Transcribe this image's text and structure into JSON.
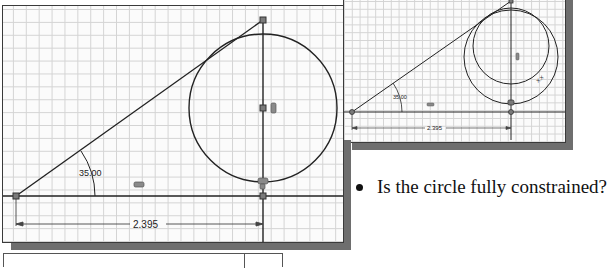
{
  "main_sketch": {
    "angle_dimension": "35.00",
    "linear_dimension": "2.395",
    "constraint_icons": [
      "horizontal-constraint-icon",
      "vertical-constraint-icon",
      "tangent-coincident-constraint-icon"
    ]
  },
  "inset_sketch": {
    "angle_dimension": "35.00",
    "linear_dimension": "2.395",
    "circle_label": "X.X"
  },
  "bullet": {
    "text": "Is the circle fully constrained?"
  },
  "colors": {
    "line": "#222222",
    "grid": "#d4d4d4",
    "shadow": "#6e6e6e",
    "point": "#7a7a7a"
  }
}
